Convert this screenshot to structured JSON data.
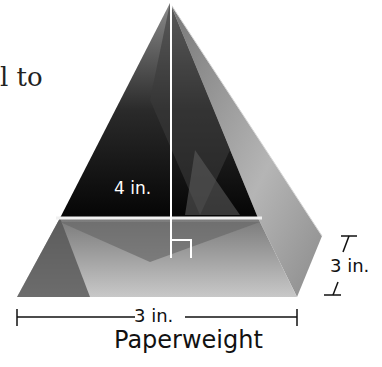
{
  "text_fragment": {
    "line1": "l to",
    "line2": ""
  },
  "figure": {
    "object": "pyramid paperweight photo",
    "height_label": "4 in.",
    "base_width_label": "3 in.",
    "base_depth_label": "3 in.",
    "right_angle_marker": true
  },
  "caption": "Paperweight",
  "colors": {
    "background": "#ffffff",
    "dark_face": "#111111",
    "light_face": "#9a9a9a",
    "annotation": "#ffffff",
    "dimension": "#111111"
  }
}
